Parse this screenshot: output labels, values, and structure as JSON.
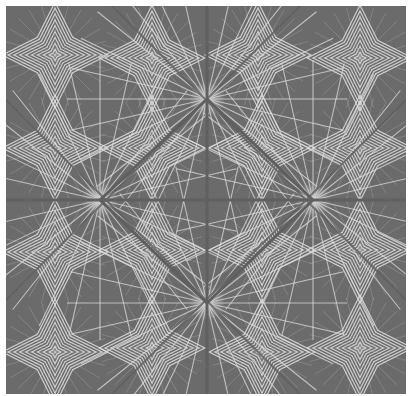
{
  "image": {
    "kind": "geometric-wallpaper-pattern",
    "description": "Gray wallpaper with white radiating starburst lines forming a diagonal diamond lattice",
    "colors": {
      "background": "#6b6b6b",
      "line": "#dedede",
      "glow": "#cfcfcf",
      "border": "#ffffff"
    },
    "frame": {
      "x": 6,
      "y": 6,
      "width": 400,
      "height": 388
    },
    "primary_focal_points": [
      [
        201,
        93
      ],
      [
        94,
        194
      ],
      [
        307,
        194
      ],
      [
        201,
        297
      ]
    ],
    "secondary_focal_points": [
      [
        49,
        49
      ],
      [
        146,
        52
      ],
      [
        252,
        49
      ],
      [
        354,
        52
      ],
      [
        49,
        142
      ],
      [
        146,
        142
      ],
      [
        256,
        142
      ],
      [
        354,
        142
      ],
      [
        49,
        246
      ],
      [
        146,
        244
      ],
      [
        256,
        244
      ],
      [
        354,
        244
      ],
      [
        49,
        346
      ],
      [
        146,
        342
      ],
      [
        256,
        346
      ],
      [
        354,
        342
      ]
    ],
    "rays_per_fan": 14,
    "ray_length": 140
  }
}
